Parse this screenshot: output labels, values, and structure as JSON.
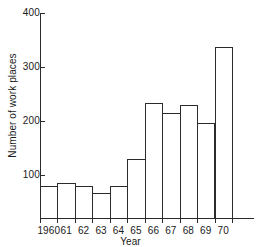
{
  "chart_data": {
    "type": "bar",
    "title": "",
    "xlabel": "Year",
    "ylabel": "Number of work places",
    "categories": [
      "1960",
      "61",
      "62",
      "63",
      "64",
      "65",
      "66",
      "67",
      "68",
      "69",
      "70"
    ],
    "values": [
      80,
      85,
      80,
      67,
      80,
      130,
      233,
      214,
      230,
      197,
      337
    ],
    "ylim": [
      0,
      400
    ],
    "yticks": [
      100,
      200,
      300,
      400
    ],
    "ytick_labels": [
      "100",
      "200",
      "300",
      "400"
    ],
    "xlim": [
      1959.5,
      1970.5
    ],
    "grid": false,
    "legend": null,
    "bar_style": {
      "fill": "none",
      "edge_color": "#2b2b2b",
      "edge_width": 1,
      "contiguous": true
    },
    "axis_color": "#2b2b2b",
    "background": "#ffffff"
  }
}
